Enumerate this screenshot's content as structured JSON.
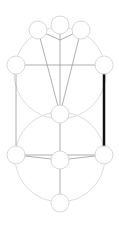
{
  "diagram": {
    "type": "graph",
    "colors": {
      "background": "#ffffff",
      "node_stroke": "#d8d8d8",
      "edge": "#9a9a9a",
      "guide_circle": "#dcdcdc",
      "highlight_edge": "#111111"
    },
    "nodes": [
      {
        "id": "top-left"
      },
      {
        "id": "top-center"
      },
      {
        "id": "top-right"
      },
      {
        "id": "mid-left"
      },
      {
        "id": "mid-right"
      },
      {
        "id": "center"
      },
      {
        "id": "low-left"
      },
      {
        "id": "low-center"
      },
      {
        "id": "low-right"
      },
      {
        "id": "bottom"
      }
    ],
    "edges": [
      {
        "from": "top-left",
        "to": "center"
      },
      {
        "from": "top-center",
        "to": "center"
      },
      {
        "from": "top-right",
        "to": "center"
      },
      {
        "from": "top-left",
        "to": "top-center-junction"
      },
      {
        "from": "top-right",
        "to": "top-center-junction"
      },
      {
        "from": "mid-left",
        "to": "mid-right"
      },
      {
        "from": "mid-left",
        "to": "low-left"
      },
      {
        "from": "mid-right",
        "to": "low-right",
        "highlighted": true
      },
      {
        "from": "center",
        "to": "low-center"
      },
      {
        "from": "low-left",
        "to": "low-right"
      },
      {
        "from": "low-left",
        "to": "low-center"
      },
      {
        "from": "low-right",
        "to": "low-center"
      },
      {
        "from": "low-center",
        "to": "bottom"
      }
    ]
  }
}
